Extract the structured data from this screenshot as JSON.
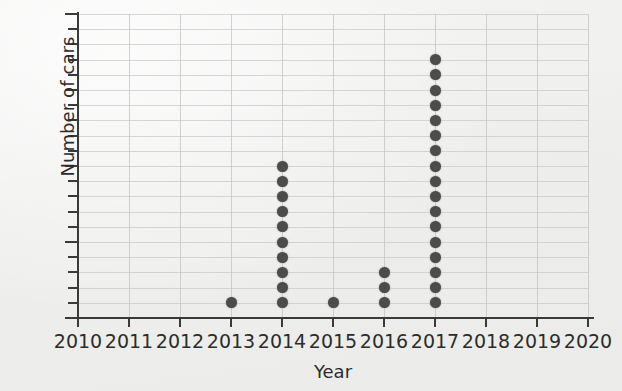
{
  "chart_data": {
    "type": "scatter",
    "plot_style": "dot-plot",
    "title": "",
    "xlabel": "Year",
    "ylabel": "Number of cars",
    "xlim": [
      2010,
      2020
    ],
    "ylim": [
      0,
      20
    ],
    "grid": true,
    "legend": null,
    "x_tick_labels": [
      "2010",
      "2011",
      "2012",
      "2013",
      "2014",
      "2015",
      "2016",
      "2017",
      "2018",
      "2019",
      "2020"
    ],
    "x_ticks": [
      2010,
      2011,
      2012,
      2013,
      2014,
      2015,
      2016,
      2017,
      2018,
      2019,
      2020
    ],
    "y_tick_labels": [
      "0",
      "5",
      "10",
      "15",
      "20"
    ],
    "y_ticks_major": [
      0,
      5,
      10,
      15,
      20
    ],
    "y_ticks_minor_step": 1,
    "x": [
      2013,
      2014,
      2015,
      2016,
      2017
    ],
    "counts": [
      1,
      10,
      1,
      3,
      17
    ],
    "points": [
      {
        "x": 2013,
        "y": 1
      },
      {
        "x": 2014,
        "y": 1
      },
      {
        "x": 2014,
        "y": 2
      },
      {
        "x": 2014,
        "y": 3
      },
      {
        "x": 2014,
        "y": 4
      },
      {
        "x": 2014,
        "y": 5
      },
      {
        "x": 2014,
        "y": 6
      },
      {
        "x": 2014,
        "y": 7
      },
      {
        "x": 2014,
        "y": 8
      },
      {
        "x": 2014,
        "y": 9
      },
      {
        "x": 2014,
        "y": 10
      },
      {
        "x": 2015,
        "y": 1
      },
      {
        "x": 2016,
        "y": 1
      },
      {
        "x": 2016,
        "y": 2
      },
      {
        "x": 2016,
        "y": 3
      },
      {
        "x": 2017,
        "y": 1
      },
      {
        "x": 2017,
        "y": 2
      },
      {
        "x": 2017,
        "y": 3
      },
      {
        "x": 2017,
        "y": 4
      },
      {
        "x": 2017,
        "y": 5
      },
      {
        "x": 2017,
        "y": 6
      },
      {
        "x": 2017,
        "y": 7
      },
      {
        "x": 2017,
        "y": 8
      },
      {
        "x": 2017,
        "y": 9
      },
      {
        "x": 2017,
        "y": 10
      },
      {
        "x": 2017,
        "y": 11
      },
      {
        "x": 2017,
        "y": 12
      },
      {
        "x": 2017,
        "y": 13
      },
      {
        "x": 2017,
        "y": 14
      },
      {
        "x": 2017,
        "y": 15
      },
      {
        "x": 2017,
        "y": 16
      },
      {
        "x": 2017,
        "y": 17
      }
    ],
    "colors": {
      "dot": "#4c4c4c",
      "axis": "#3a3a3a",
      "gridline": "#c9c9c7",
      "background": "#f1f1f0",
      "text": "#2c2c2c"
    }
  }
}
